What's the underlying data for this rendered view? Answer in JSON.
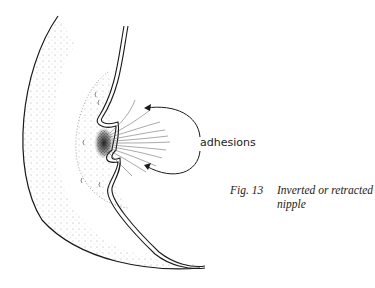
{
  "figure": {
    "label": "adhesions",
    "caption_number": "Fig. 13",
    "caption_text_line1": "Inverted or retracted",
    "caption_text_line2": "nipple",
    "ink_color": "#1a1a1a"
  }
}
